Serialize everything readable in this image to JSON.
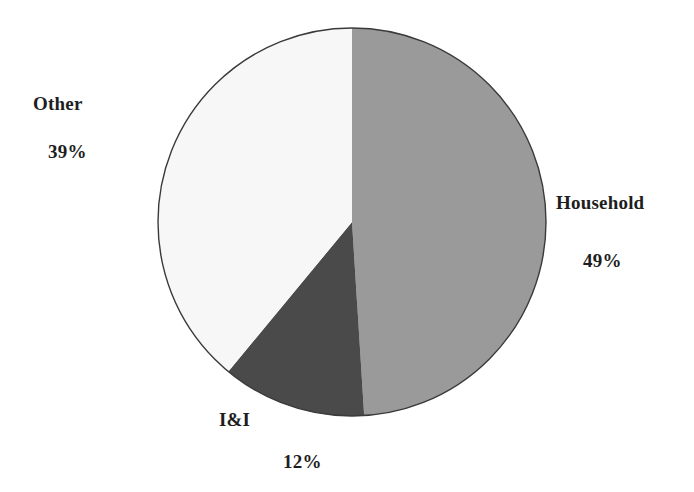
{
  "chart_data": {
    "type": "pie",
    "title": "",
    "start_angle_deg": 0,
    "direction": "clockwise",
    "slices": [
      {
        "label": "Household",
        "value": 49,
        "display": "49%",
        "color": "#9a9a9a"
      },
      {
        "label": "I&I",
        "value": 12,
        "display": "12%",
        "color": "#4a4a4a"
      },
      {
        "label": "Other",
        "value": 39,
        "display": "39%",
        "color": "#f7f7f7"
      }
    ],
    "legend": "none",
    "labels_outside": true
  },
  "labels": {
    "household": {
      "name": "Household",
      "pct": "49%"
    },
    "ii": {
      "name": "I&I",
      "pct": "12%"
    },
    "other": {
      "name": "Other",
      "pct": "39%"
    }
  }
}
